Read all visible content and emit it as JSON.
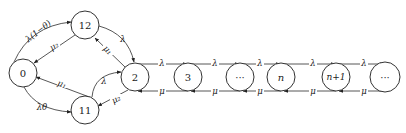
{
  "diagram": {
    "type": "state-transition",
    "nodes": [
      {
        "id": "0",
        "label": "0",
        "cx": 23,
        "cy": 73,
        "r": 14
      },
      {
        "id": "12",
        "label": "12",
        "cx": 85,
        "cy": 25,
        "r": 14
      },
      {
        "id": "11",
        "label": "11",
        "cx": 85,
        "cy": 110,
        "r": 14
      },
      {
        "id": "2",
        "label": "2",
        "cx": 135,
        "cy": 77,
        "r": 14
      },
      {
        "id": "3",
        "label": "3",
        "cx": 188,
        "cy": 77,
        "r": 14
      },
      {
        "id": "dots1",
        "label": "···",
        "cx": 240,
        "cy": 77,
        "r": 14
      },
      {
        "id": "n",
        "label": "n",
        "cx": 281,
        "cy": 77,
        "r": 14
      },
      {
        "id": "n1",
        "label": "n+1",
        "cx": 336,
        "cy": 77,
        "r": 14
      },
      {
        "id": "dots2",
        "label": "···",
        "cx": 385,
        "cy": 77,
        "r": 15
      }
    ],
    "edges": [
      {
        "from": "0",
        "to": "12",
        "label": "λ(1−θ)"
      },
      {
        "from": "12",
        "to": "0",
        "label": "μ2"
      },
      {
        "from": "0",
        "to": "11",
        "label": "λθ"
      },
      {
        "from": "11",
        "to": "0",
        "label": "μ1"
      },
      {
        "from": "12",
        "to": "2",
        "label": "λ"
      },
      {
        "from": "2",
        "to": "12",
        "label": "μ1"
      },
      {
        "from": "11",
        "to": "2",
        "label": "λ"
      },
      {
        "from": "2",
        "to": "11",
        "label": "μ2"
      },
      {
        "from": "2",
        "to": "3",
        "label": "λ"
      },
      {
        "from": "3",
        "to": "2",
        "label": "μ"
      },
      {
        "from": "3",
        "to": "dots1",
        "label": "λ"
      },
      {
        "from": "dots1",
        "to": "3",
        "label": "μ"
      },
      {
        "from": "dots1",
        "to": "n",
        "label": "λ"
      },
      {
        "from": "n",
        "to": "dots1",
        "label": "μ"
      },
      {
        "from": "n",
        "to": "n1",
        "label": "λ"
      },
      {
        "from": "n1",
        "to": "n",
        "label": "μ"
      },
      {
        "from": "n1",
        "to": "dots2",
        "label": "λ"
      },
      {
        "from": "dots2",
        "to": "n1",
        "label": "μ"
      }
    ],
    "labels": {
      "e_0_12": "λ(1−θ)",
      "e_12_0": "μ₂",
      "e_0_11": "λθ",
      "e_11_0": "μ₁",
      "e_12_2": "λ",
      "e_2_12": "μ₁",
      "e_11_2": "λ",
      "e_2_11": "μ₂",
      "e_2_3": "λ",
      "e_3_2": "μ",
      "e_3_d1": "λ",
      "e_d1_3": "μ",
      "e_d1_n": "λ",
      "e_n_d1": "μ",
      "e_n_n1": "λ",
      "e_n1_n": "μ",
      "e_n1_d2": "λ",
      "e_d2_n1": "μ"
    },
    "node_labels": {
      "n0": "0",
      "n12": "12",
      "n11": "11",
      "n2": "2",
      "n3": "3",
      "nd1": "···",
      "nn": "n",
      "nn1": "n+1",
      "nd2": "···"
    }
  }
}
